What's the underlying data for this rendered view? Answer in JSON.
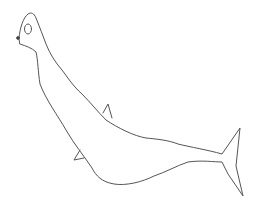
{
  "image": {
    "description": "Hand-drawn pencil line sketch of a seal-like creature",
    "width": 272,
    "height": 205,
    "background": "#ffffff",
    "stroke_color": "#555555",
    "stroke_width": 1
  }
}
